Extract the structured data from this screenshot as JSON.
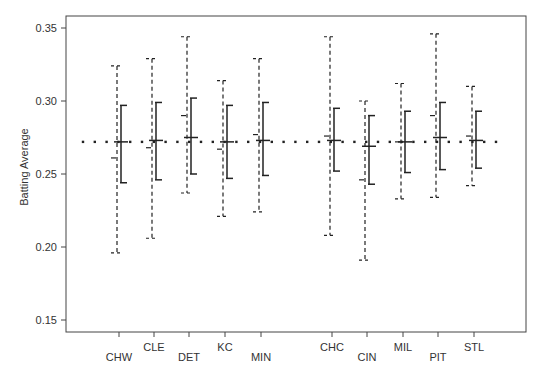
{
  "chart_data": {
    "type": "errorbar",
    "title": "",
    "xlabel": "",
    "ylabel": "Batting Average",
    "ylim": [
      0.14,
      0.358
    ],
    "yticks": [
      0.15,
      0.2,
      0.25,
      0.3,
      0.35
    ],
    "ytick_labels": [
      "0.15",
      "0.20",
      "0.25",
      "0.30",
      "0.35"
    ],
    "grid": false,
    "legend": null,
    "reference_line": {
      "value": 0.272,
      "style": "dotted"
    },
    "groups": [
      {
        "name": "left group",
        "categories": [
          "CHW",
          "CLE",
          "DET",
          "KC",
          "MIN"
        ]
      },
      {
        "name": "right group",
        "categories": [
          "CHC",
          "CIN",
          "MIL",
          "PIT",
          "STL"
        ]
      }
    ],
    "categories": [
      "CHW",
      "CLE",
      "DET",
      "KC",
      "MIN",
      "CHC",
      "CIN",
      "MIL",
      "PIT",
      "STL"
    ],
    "series": [
      {
        "name": "wide interval (dashed)",
        "style": "dashed",
        "center": [
          0.261,
          0.268,
          0.29,
          0.267,
          0.277,
          0.276,
          0.246,
          0.272,
          0.29,
          0.276
        ],
        "lower": [
          0.196,
          0.206,
          0.237,
          0.221,
          0.224,
          0.208,
          0.191,
          0.233,
          0.234,
          0.242
        ],
        "upper": [
          0.324,
          0.329,
          0.344,
          0.314,
          0.329,
          0.344,
          0.3,
          0.312,
          0.346,
          0.31
        ]
      },
      {
        "name": "narrow interval (solid)",
        "style": "solid",
        "center": [
          0.272,
          0.273,
          0.275,
          0.272,
          0.273,
          0.273,
          0.269,
          0.272,
          0.275,
          0.273
        ],
        "lower": [
          0.244,
          0.246,
          0.25,
          0.247,
          0.249,
          0.252,
          0.243,
          0.251,
          0.253,
          0.254
        ],
        "upper": [
          0.297,
          0.299,
          0.302,
          0.297,
          0.299,
          0.295,
          0.29,
          0.293,
          0.299,
          0.293
        ]
      }
    ],
    "x_positions_px": [
      119,
      154,
      189,
      225,
      261,
      332,
      367,
      403,
      438,
      474
    ],
    "label_rows": [
      "low",
      "high",
      "low",
      "high",
      "low",
      "high",
      "low",
      "high",
      "low",
      "high"
    ]
  },
  "colors": {
    "axis": "#444444",
    "dashed": "#222222",
    "solid": "#222222",
    "text": "#333333",
    "background": "#ffffff"
  }
}
